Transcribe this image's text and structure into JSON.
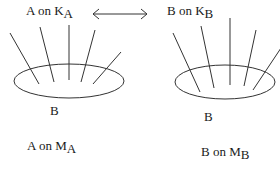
{
  "diagram": {
    "left": {
      "top_label": {
        "text": "A on K",
        "subscript": "A"
      },
      "inner_label": "B",
      "bottom_label": {
        "text": "A on M",
        "subscript": "A"
      }
    },
    "right": {
      "top_label": {
        "text": "B on K",
        "subscript": "B"
      },
      "inner_label": "B",
      "bottom_label": {
        "text": "B on M",
        "subscript": "B"
      }
    },
    "connector": {
      "type": "double-headed-arrow",
      "icon": "left-right-arrow"
    },
    "colors": {
      "stroke": "#333333",
      "text": "#1a1a1a",
      "background": "#ffffff"
    }
  }
}
